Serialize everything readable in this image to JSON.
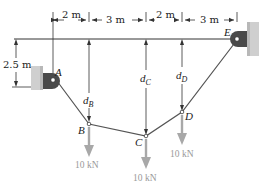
{
  "figure": {
    "type": "cable-structure-diagram",
    "colors": {
      "line": "#333333",
      "cable": "#555555",
      "load_arrow": "#a8a8a8",
      "load_text": "#9a9a9a",
      "wall": "#cfcfcf",
      "bracket": "#4a4a4a"
    },
    "supports": {
      "A": {
        "label": "A"
      },
      "E": {
        "label": "E"
      }
    },
    "points": {
      "B": {
        "label": "B"
      },
      "C": {
        "label": "C"
      },
      "D": {
        "label": "D"
      }
    },
    "dimensions": {
      "horizontal": [
        "2 m",
        "3 m",
        "2 m",
        "3 m"
      ],
      "vertical_A": "2.5 m"
    },
    "sag_labels": {
      "B": {
        "main": "d",
        "sub": "B"
      },
      "C": {
        "main": "d",
        "sub": "C"
      },
      "D": {
        "main": "d",
        "sub": "D"
      }
    },
    "loads": {
      "B": "10 kN",
      "C": "10 kN",
      "D": "10 kN"
    }
  }
}
